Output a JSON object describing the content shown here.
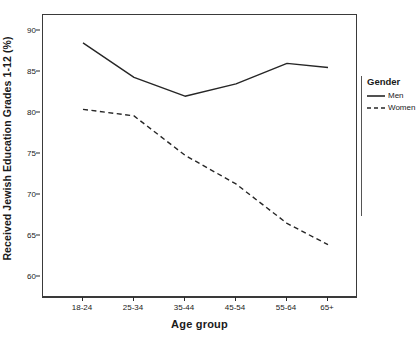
{
  "chart_data": {
    "type": "line",
    "title": "",
    "subtitle": "",
    "xlabel": "Age group",
    "ylabel": "Received Jewish Education Grades 1-12 (%)",
    "categories": [
      "18-24",
      "25-34",
      "35-44",
      "45-54",
      "55-64",
      "65+"
    ],
    "ylim": [
      57.5,
      92
    ],
    "yticks": [
      60,
      65,
      70,
      75,
      80,
      85,
      90
    ],
    "ytick_labels": [
      "60",
      "65",
      "70",
      "75",
      "80",
      "85",
      "90"
    ],
    "grid": false,
    "legend_position": "right",
    "legend_title": "Gender",
    "series": [
      {
        "name": "Men",
        "linestyle": "solid",
        "color": "#262626",
        "values": [
          88.6,
          84.4,
          82.1,
          83.6,
          86.1,
          85.6
        ]
      },
      {
        "name": "Women",
        "linestyle": "dashed",
        "color": "#262626",
        "values": [
          80.5,
          79.7,
          74.9,
          71.4,
          66.6,
          64.0
        ]
      }
    ]
  },
  "legend": {
    "title": "Gender",
    "entries": [
      {
        "label": "Men",
        "style": "solid-line-swatch"
      },
      {
        "label": "Women",
        "style": "dashed-line-swatch"
      }
    ]
  },
  "axes": {
    "x_title": "Age group",
    "y_title": "Received Jewish Education Grades 1-12 (%)"
  },
  "colors": {
    "line": "#262626",
    "frame": "#3a3a3a",
    "background": "#ffffff",
    "text": "#1a1a1a"
  }
}
